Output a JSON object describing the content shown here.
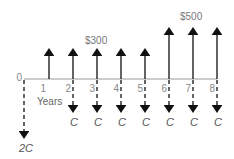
{
  "diagram": {
    "type": "cash-flow-diagram",
    "axis_label": "Years",
    "origin_label": "0",
    "periods": [
      "1",
      "2",
      "3",
      "4",
      "5",
      "6",
      "7",
      "8"
    ],
    "inflows": [
      {
        "year": 1,
        "amount": 300
      },
      {
        "year": 2,
        "amount": 300
      },
      {
        "year": 3,
        "amount": 300
      },
      {
        "year": 4,
        "amount": 300
      },
      {
        "year": 5,
        "amount": 300
      },
      {
        "year": 6,
        "amount": 500
      },
      {
        "year": 7,
        "amount": 500
      },
      {
        "year": 8,
        "amount": 500
      }
    ],
    "outflows": [
      {
        "year": 0,
        "label": "2C"
      },
      {
        "year": 2,
        "label": "C"
      },
      {
        "year": 3,
        "label": "C"
      },
      {
        "year": 4,
        "label": "C"
      },
      {
        "year": 5,
        "label": "C"
      },
      {
        "year": 6,
        "label": "C"
      },
      {
        "year": 7,
        "label": "C"
      },
      {
        "year": 8,
        "label": "C"
      }
    ],
    "inflow_label_low": "$300",
    "inflow_label_high": "$500",
    "outflow_labels": {
      "y0": "2C",
      "y2": "C",
      "y3": "C",
      "y4": "C",
      "y5": "C",
      "y6": "C",
      "y7": "C",
      "y8": "C"
    },
    "tick_labels": {
      "t0": "0",
      "t1": "1",
      "t2": "2",
      "t3": "3",
      "t4": "4",
      "t5": "5",
      "t6": "6",
      "t7": "7",
      "t8": "8"
    }
  }
}
